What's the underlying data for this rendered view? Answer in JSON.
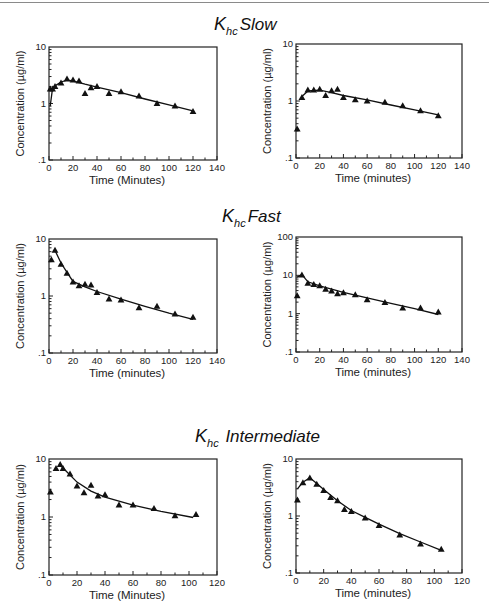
{
  "sections": [
    {
      "k": "K",
      "sub": "hc",
      "label": "Slow"
    },
    {
      "k": "K",
      "sub": "hc",
      "label": "Fast"
    },
    {
      "k": "K",
      "sub": "hc",
      "label": "Intermediate"
    }
  ],
  "chart_data": [
    {
      "type": "scatter",
      "section": "Khc Slow",
      "position": "top-left",
      "xlabel": "Time (Minutes)",
      "ylabel": "Concentration (µg/ml)",
      "xlim": [
        0,
        140
      ],
      "xticks": [
        0,
        20,
        40,
        60,
        80,
        100,
        120,
        140
      ],
      "yscale": "log",
      "ylim": [
        0.1,
        10
      ],
      "yticks": [
        ".1",
        "1",
        "10"
      ],
      "points": {
        "x": [
          1,
          3,
          5,
          10,
          15,
          20,
          25,
          30,
          35,
          40,
          50,
          60,
          75,
          90,
          105,
          120
        ],
        "y": [
          1.8,
          1.8,
          2.0,
          2.3,
          2.7,
          2.6,
          2.5,
          1.5,
          1.9,
          2.0,
          1.5,
          1.6,
          1.35,
          1.0,
          0.9,
          0.72
        ]
      },
      "fit_line": {
        "x": [
          1,
          3,
          5,
          10,
          15,
          20,
          30,
          40,
          60,
          80,
          100,
          120
        ],
        "y": [
          0.9,
          1.9,
          2.05,
          2.4,
          2.6,
          2.5,
          2.2,
          1.95,
          1.55,
          1.2,
          0.95,
          0.74
        ]
      }
    },
    {
      "type": "scatter",
      "section": "Khc Slow",
      "position": "top-right",
      "xlabel": "Time (minutes)",
      "ylabel": "Concentration (µg/ml)",
      "xlim": [
        0,
        140
      ],
      "xticks": [
        0,
        20,
        40,
        60,
        80,
        100,
        120,
        140
      ],
      "yscale": "log",
      "ylim": [
        0.1,
        10
      ],
      "yticks": [
        ".1",
        "1",
        "10"
      ],
      "points": {
        "x": [
          1,
          5,
          10,
          15,
          20,
          25,
          30,
          35,
          40,
          50,
          60,
          75,
          90,
          105,
          120
        ],
        "y": [
          0.32,
          1.15,
          1.55,
          1.55,
          1.6,
          1.25,
          1.5,
          1.6,
          1.15,
          1.05,
          1.0,
          0.95,
          0.82,
          0.67,
          0.55
        ]
      },
      "fit_line": {
        "x": [
          5,
          10,
          20,
          30,
          40,
          60,
          80,
          100,
          120
        ],
        "y": [
          1.2,
          1.5,
          1.55,
          1.4,
          1.25,
          1.05,
          0.85,
          0.7,
          0.57
        ]
      }
    },
    {
      "type": "scatter",
      "section": "Khc Fast",
      "position": "middle-left",
      "xlabel": "Time (minutes)",
      "ylabel": "Concentration (µg/ml)",
      "xlim": [
        0,
        140
      ],
      "xticks": [
        0,
        20,
        40,
        60,
        80,
        100,
        120,
        140
      ],
      "yscale": "log",
      "ylim": [
        0.1,
        10
      ],
      "yticks": [
        ".1",
        "1",
        "10"
      ],
      "points": {
        "x": [
          2,
          5,
          10,
          15,
          20,
          25,
          30,
          35,
          40,
          50,
          60,
          75,
          90,
          105,
          120
        ],
        "y": [
          4.3,
          6.3,
          3.6,
          2.5,
          1.75,
          1.5,
          1.6,
          1.55,
          1.15,
          0.88,
          0.85,
          0.62,
          0.66,
          0.48,
          0.42
        ]
      },
      "fit_line": {
        "x": [
          5,
          10,
          15,
          20,
          30,
          40,
          60,
          80,
          100,
          120
        ],
        "y": [
          6.3,
          3.8,
          2.6,
          1.8,
          1.45,
          1.2,
          0.88,
          0.66,
          0.5,
          0.39
        ]
      }
    },
    {
      "type": "scatter",
      "section": "Khc Fast",
      "position": "middle-right",
      "xlabel": "Time (minutes)",
      "ylabel": "Concentration (µg/ml)",
      "xlim": [
        0,
        140
      ],
      "xticks": [
        0,
        20,
        40,
        60,
        80,
        100,
        120,
        140
      ],
      "yscale": "log",
      "ylim": [
        0.1,
        100
      ],
      "yticks": [
        ".1",
        "1",
        "10",
        "100"
      ],
      "points": {
        "x": [
          1,
          5,
          10,
          15,
          20,
          25,
          30,
          35,
          40,
          50,
          60,
          75,
          90,
          105,
          120
        ],
        "y": [
          2.9,
          10.2,
          6.2,
          5.7,
          5.3,
          4.3,
          3.9,
          3.3,
          3.5,
          3.1,
          2.3,
          1.95,
          1.4,
          1.4,
          1.1
        ]
      },
      "fit_line": {
        "x": [
          1,
          5,
          10,
          20,
          40,
          60,
          80,
          100,
          120
        ],
        "y": [
          9.0,
          10.5,
          6.8,
          5.3,
          3.6,
          2.6,
          1.85,
          1.35,
          0.95
        ]
      }
    },
    {
      "type": "scatter",
      "section": "Khc Intermediate",
      "position": "bottom-left",
      "xlabel": "Time (Minutes)",
      "ylabel": "Concentration (µg/ml)",
      "xlim": [
        0,
        120
      ],
      "xticks": [
        0,
        20,
        40,
        60,
        80,
        100,
        120
      ],
      "yscale": "log",
      "ylim": [
        0.1,
        10
      ],
      "yticks": [
        ".1",
        "1",
        "10"
      ],
      "points": {
        "x": [
          1,
          5,
          8,
          10,
          15,
          20,
          25,
          30,
          35,
          40,
          50,
          60,
          75,
          90,
          105
        ],
        "y": [
          2.7,
          6.8,
          8.0,
          6.8,
          5.5,
          3.4,
          2.6,
          3.5,
          2.3,
          2.4,
          1.6,
          1.6,
          1.4,
          1.05,
          1.1
        ]
      },
      "fit_line": {
        "x": [
          8,
          10,
          15,
          20,
          30,
          40,
          60,
          80,
          103
        ],
        "y": [
          7.8,
          7.0,
          5.3,
          4.0,
          2.8,
          2.2,
          1.6,
          1.25,
          0.98
        ]
      }
    },
    {
      "type": "scatter",
      "section": "Khc Intermediate",
      "position": "bottom-right",
      "xlabel": "Time (minutes)",
      "ylabel": "Concentration (µg/ml)",
      "xlim": [
        0,
        120
      ],
      "xticks": [
        0,
        20,
        40,
        60,
        80,
        100,
        120
      ],
      "yscale": "log",
      "ylim": [
        0.1,
        10
      ],
      "yticks": [
        ".1",
        "1",
        "10"
      ],
      "points": {
        "x": [
          1,
          5,
          10,
          15,
          20,
          25,
          30,
          35,
          40,
          50,
          60,
          75,
          90,
          105
        ],
        "y": [
          1.9,
          3.8,
          4.6,
          3.6,
          2.8,
          2.1,
          1.85,
          1.3,
          1.2,
          0.92,
          0.68,
          0.46,
          0.32,
          0.26
        ]
      },
      "fit_line": {
        "x": [
          1,
          5,
          10,
          15,
          20,
          30,
          40,
          50,
          60,
          75,
          90,
          105
        ],
        "y": [
          3.0,
          3.9,
          4.7,
          3.7,
          2.9,
          1.85,
          1.25,
          0.95,
          0.72,
          0.49,
          0.35,
          0.25
        ]
      }
    }
  ]
}
